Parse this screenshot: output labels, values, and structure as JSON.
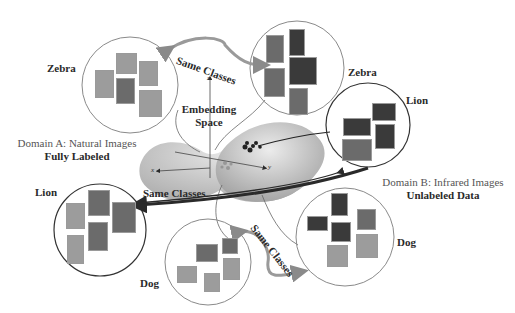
{
  "diagram": {
    "center": {
      "title_line1": "Embedding",
      "title_line2": "Space",
      "axis_z": "z",
      "axis_x": "x",
      "axis_y": "y"
    },
    "domain_a": {
      "title": "Domain A:  Natural Images",
      "subtitle": "Fully Labeled"
    },
    "domain_b": {
      "title": "Domain B:  Infrared Images",
      "subtitle": "Unlabeled Data"
    },
    "clusters": {
      "zebra_a": {
        "label": "Zebra",
        "domain": "A"
      },
      "zebra_b": {
        "label": "Zebra",
        "domain": "B"
      },
      "lion_a": {
        "label": "Lion",
        "domain": "A"
      },
      "lion_b": {
        "label": "Lion",
        "domain": "B"
      },
      "dog_a": {
        "label": "Dog",
        "domain": "A"
      },
      "dog_b": {
        "label": "Dog",
        "domain": "B"
      }
    },
    "links": {
      "zebra": "Same Classes",
      "lion": "Same Classes",
      "dog": "Same Classes"
    },
    "colors": {
      "circle_a": "#8a8a8a",
      "circle_b": "#333333",
      "arrow_gray": "#9a9a9a",
      "arrow_dark": "#2a2a2a",
      "manifold": "#b8b8b8"
    }
  }
}
